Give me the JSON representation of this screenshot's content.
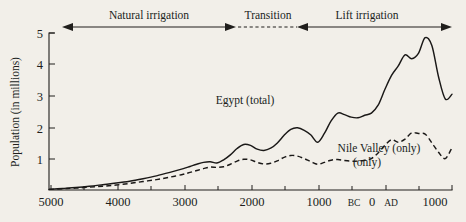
{
  "chart_data": {
    "type": "line",
    "title": "",
    "xlabel": "",
    "ylabel": "Population (in millions)",
    "xlim": [
      -5000,
      1000
    ],
    "ylim": [
      0,
      5
    ],
    "grid": false,
    "legend_position": "inline-annotation",
    "x_tick_labels": [
      "5000",
      "4000",
      "3000",
      "2000",
      "1000",
      "BC",
      "0",
      "AD",
      "1000"
    ],
    "x_tick_values": [
      -5000,
      -4000,
      -3000,
      -2000,
      -1000,
      -200,
      0,
      200,
      1000
    ],
    "x_minor_tick_values": [
      -5000,
      -4500,
      -4000,
      -3500,
      -3000,
      -2500,
      -2000,
      -1500,
      -1000,
      -500,
      0,
      500,
      1000
    ],
    "y_tick_labels": [
      "1",
      "2",
      "3",
      "4",
      "5"
    ],
    "y_tick_values": [
      1,
      2,
      3,
      4,
      5
    ],
    "annotations": [
      {
        "label": "Natural irrigation",
        "x_start": -5000,
        "x_end": -2350,
        "style": "solid-double-arrow"
      },
      {
        "label": "Transition",
        "x_start": -2350,
        "x_end": -1100,
        "style": "dashed-double-arrow"
      },
      {
        "label": "Lift irrigation",
        "x_start": -1100,
        "x_end": 1000,
        "style": "solid-double-arrow"
      }
    ],
    "series": [
      {
        "name": "Egypt (total)",
        "style": "solid",
        "label_x": -2050,
        "label_y": 2.62,
        "x": [
          -5000,
          -4800,
          -4600,
          -4400,
          -4200,
          -4000,
          -3800,
          -3600,
          -3400,
          -3200,
          -3000,
          -2900,
          -2800,
          -2700,
          -2600,
          -2500,
          -2400,
          -2300,
          -2200,
          -2100,
          -2000,
          -1900,
          -1800,
          -1700,
          -1600,
          -1500,
          -1400,
          -1300,
          -1200,
          -1100,
          -1000,
          -900,
          -800,
          -700,
          -600,
          -500,
          -400,
          -300,
          -200,
          -100,
          0,
          100,
          200,
          300,
          400,
          500,
          600,
          700,
          800,
          900,
          1000
        ],
        "y": [
          0.02,
          0.05,
          0.08,
          0.12,
          0.17,
          0.22,
          0.28,
          0.36,
          0.45,
          0.56,
          0.68,
          0.75,
          0.82,
          0.88,
          0.9,
          0.86,
          0.96,
          1.12,
          1.32,
          1.45,
          1.42,
          1.3,
          1.26,
          1.33,
          1.5,
          1.74,
          1.93,
          1.98,
          1.9,
          1.75,
          1.52,
          1.8,
          2.2,
          2.45,
          2.4,
          2.32,
          2.3,
          2.38,
          2.45,
          2.7,
          3.2,
          3.65,
          3.95,
          4.3,
          4.18,
          4.35,
          4.85,
          4.6,
          3.6,
          2.9,
          3.05
        ]
      },
      {
        "name": "Nile Valley (only)",
        "style": "dashed",
        "label_x": -160,
        "label_y": 1.32,
        "label_line2": "(only)",
        "x": [
          -5000,
          -4800,
          -4600,
          -4400,
          -4200,
          -4000,
          -3800,
          -3600,
          -3400,
          -3200,
          -3000,
          -2900,
          -2800,
          -2700,
          -2600,
          -2500,
          -2400,
          -2300,
          -2200,
          -2100,
          -2000,
          -1900,
          -1800,
          -1700,
          -1600,
          -1500,
          -1400,
          -1300,
          -1200,
          -1100,
          -1000,
          -900,
          -800,
          -700,
          -600,
          -500,
          -400,
          -300,
          -200,
          -100,
          0,
          100,
          200,
          300,
          400,
          500,
          600,
          700,
          800,
          900,
          1000
        ],
        "y": [
          0.02,
          0.04,
          0.06,
          0.09,
          0.12,
          0.16,
          0.21,
          0.27,
          0.33,
          0.41,
          0.5,
          0.56,
          0.62,
          0.68,
          0.73,
          0.72,
          0.74,
          0.82,
          0.92,
          0.98,
          0.96,
          0.88,
          0.83,
          0.85,
          0.93,
          1.04,
          1.1,
          1.08,
          1.0,
          0.9,
          0.82,
          0.88,
          0.95,
          0.97,
          0.94,
          0.92,
          0.92,
          0.95,
          1.0,
          1.18,
          1.42,
          1.6,
          1.52,
          1.62,
          1.82,
          1.8,
          1.78,
          1.5,
          1.2,
          1.0,
          1.35
        ]
      }
    ]
  }
}
